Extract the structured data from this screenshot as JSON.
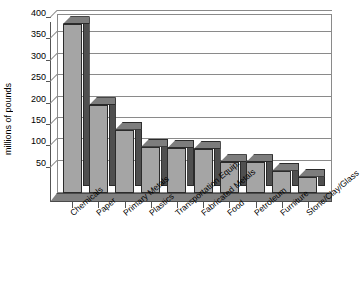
{
  "chart_data": {
    "type": "bar",
    "title": "",
    "subtitle": "",
    "xlabel": "",
    "ylabel": "millions of pounds",
    "ylim": [
      0,
      400
    ],
    "yticks": [
      0,
      50,
      100,
      150,
      200,
      250,
      300,
      350,
      400
    ],
    "ytick_labels": [
      "",
      "50",
      "100",
      "150",
      "200",
      "250",
      "300",
      "350",
      "400"
    ],
    "grid": true,
    "legend": false,
    "legend_position": "none",
    "style": "3d-column",
    "bar_color": "#a5a5a5",
    "bar_side_color": "#4f4f4f",
    "bar_top_color": "#7d7d7d",
    "floor_color": "#808080",
    "frame_color": "#8a8a8a",
    "categories": [
      "Chemicals",
      "Paper",
      "Primary Metals",
      "Plastics",
      "Transportation Equip.",
      "Fabricated Metals",
      "Food",
      "Petroleum",
      "Furniture",
      "Stone/Clay/Glass"
    ],
    "values": [
      395,
      205,
      148,
      108,
      105,
      103,
      72,
      72,
      52,
      38
    ]
  }
}
